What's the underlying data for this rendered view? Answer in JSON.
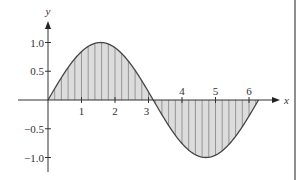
{
  "chart_data": {
    "type": "area",
    "title": "",
    "function": "y = sin(x)",
    "xlabel": "x",
    "ylabel": "y",
    "xlim": [
      0,
      6.2832
    ],
    "ylim": [
      -1.0,
      1.0
    ],
    "x_ticks": [
      1,
      2,
      3,
      4,
      5,
      6
    ],
    "x_tick_labels": [
      "1",
      "2",
      "3",
      "4",
      "5",
      "6"
    ],
    "y_ticks": [
      1.0,
      0.5,
      -0.5,
      -1.0
    ],
    "y_tick_labels": [
      "1.0",
      "0.5",
      "−0.5",
      "−1.0"
    ],
    "series": [
      {
        "name": "sin(x)",
        "x": [
          0,
          0.5236,
          1.0472,
          1.5708,
          2.0944,
          2.618,
          3.1416,
          3.6652,
          4.1888,
          4.7124,
          5.236,
          5.7596,
          6.2832
        ],
        "values": [
          0,
          0.5,
          0.866,
          1.0,
          0.866,
          0.5,
          0,
          -0.5,
          -0.866,
          -1.0,
          -0.866,
          -0.5,
          0
        ]
      }
    ],
    "shading": "region between curve and x-axis shaded gray with vertical hatch lines (Riemann-style strips)",
    "grid": false,
    "legend": null
  },
  "style": {
    "curve_color": "#444444",
    "fill_color": "#dcdcdc",
    "hatch_color": "#8c8c8c",
    "axis_color": "#333333"
  }
}
